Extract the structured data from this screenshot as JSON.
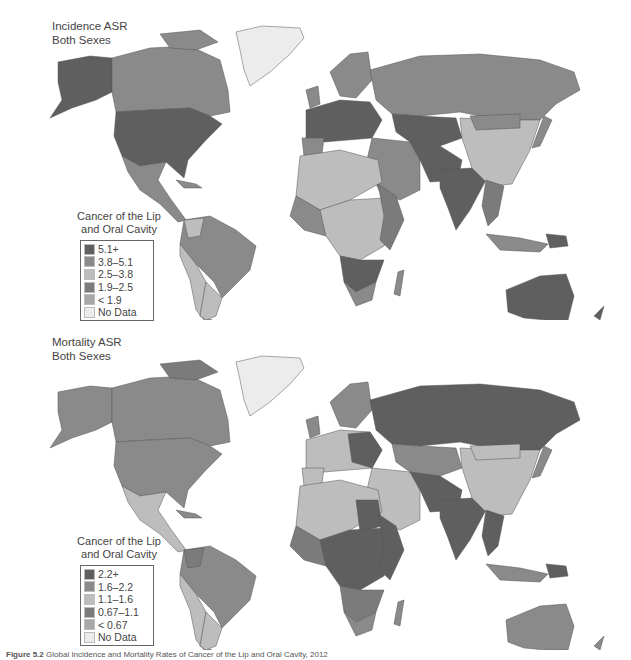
{
  "incidence_map": {
    "title_line1": "Incidence ASR",
    "title_line2": "Both Sexes",
    "legend": {
      "title_line1": "Cancer of the Lip",
      "title_line2": "and Oral Cavity",
      "items": [
        {
          "label": "5.1+",
          "color": "#5f5f5f"
        },
        {
          "label": "3.8–5.1",
          "color": "#8a8a8a"
        },
        {
          "label": "2.5–3.8",
          "color": "#bdbdbd"
        },
        {
          "label": "1.9–2.5",
          "color": "#7b7b7b"
        },
        {
          "label": "< 1.9",
          "color": "#a8a8a8"
        },
        {
          "label": "No Data",
          "color": "#ececec"
        }
      ]
    }
  },
  "mortality_map": {
    "title_line1": "Mortality ASR",
    "title_line2": "Both Sexes",
    "legend": {
      "title_line1": "Cancer of the Lip",
      "title_line2": "and Oral Cavity",
      "items": [
        {
          "label": "2.2+",
          "color": "#5f5f5f"
        },
        {
          "label": "1.6–2.2",
          "color": "#8a8a8a"
        },
        {
          "label": "1.1–1.6",
          "color": "#bdbdbd"
        },
        {
          "label": "0.67–1.1",
          "color": "#7b7b7b"
        },
        {
          "label": "< 0.67",
          "color": "#a8a8a8"
        },
        {
          "label": "No Data",
          "color": "#ececec"
        }
      ]
    }
  },
  "caption": {
    "label": "Figure 5.2",
    "text": "Global Incidence and Mortality Rates of Cancer of the Lip and Oral Cavity, 2012"
  }
}
